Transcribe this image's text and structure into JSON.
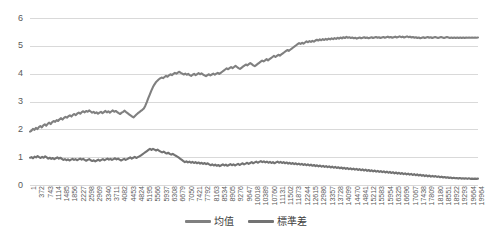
{
  "chart_data": {
    "type": "line",
    "title": "",
    "xlabel": "",
    "ylabel": "",
    "ylim": [
      0,
      6
    ],
    "yticks": [
      0,
      1,
      2,
      3,
      4,
      5,
      6
    ],
    "grid": true,
    "legend_position": "bottom",
    "x_tick_step": 371,
    "x_first": 1,
    "x_last": 19964,
    "xtick_labels": [
      "1",
      "372",
      "743",
      "1114",
      "1485",
      "1856",
      "2227",
      "2598",
      "2969",
      "3340",
      "3711",
      "4082",
      "4453",
      "4824",
      "5195",
      "5566",
      "5937",
      "6308",
      "6679",
      "7050",
      "7421",
      "7792",
      "8163",
      "8534",
      "8905",
      "9276",
      "9647",
      "10018",
      "10389",
      "10760",
      "11131",
      "11502",
      "11873",
      "12244",
      "12615",
      "12986",
      "13357",
      "13728",
      "14099",
      "14470",
      "14841",
      "15212",
      "15583",
      "15954",
      "16325",
      "16696",
      "17067",
      "17438",
      "17809",
      "18180",
      "18551",
      "18922",
      "19293",
      "19664",
      "19964"
    ],
    "series": [
      {
        "name": "均值",
        "color": "#808080",
        "values": [
          1.92,
          1.95,
          2.02,
          1.98,
          2.05,
          2.01,
          2.08,
          2.12,
          2.07,
          2.14,
          2.18,
          2.13,
          2.2,
          2.24,
          2.19,
          2.26,
          2.3,
          2.27,
          2.33,
          2.3,
          2.36,
          2.4,
          2.35,
          2.41,
          2.45,
          2.42,
          2.47,
          2.5,
          2.46,
          2.52,
          2.55,
          2.51,
          2.57,
          2.6,
          2.56,
          2.62,
          2.65,
          2.61,
          2.66,
          2.63,
          2.68,
          2.64,
          2.6,
          2.63,
          2.58,
          2.61,
          2.56,
          2.6,
          2.63,
          2.58,
          2.62,
          2.66,
          2.61,
          2.65,
          2.6,
          2.64,
          2.68,
          2.63,
          2.66,
          2.62,
          2.58,
          2.55,
          2.6,
          2.63,
          2.67,
          2.62,
          2.58,
          2.54,
          2.5,
          2.46,
          2.43,
          2.48,
          2.53,
          2.58,
          2.62,
          2.66,
          2.7,
          2.75,
          2.85,
          2.98,
          3.12,
          3.25,
          3.38,
          3.5,
          3.6,
          3.68,
          3.74,
          3.79,
          3.83,
          3.86,
          3.84,
          3.88,
          3.92,
          3.89,
          3.94,
          3.98,
          3.95,
          3.99,
          4.03,
          4.0,
          4.04,
          4.07,
          4.03,
          4.0,
          3.97,
          4.0,
          3.96,
          3.99,
          3.95,
          3.92,
          3.96,
          3.99,
          3.95,
          3.98,
          4.02,
          3.98,
          4.01,
          3.97,
          3.94,
          3.91,
          3.95,
          3.98,
          3.94,
          3.97,
          4.0,
          3.96,
          4.0,
          4.03,
          3.99,
          4.03,
          4.07,
          4.11,
          4.15,
          4.19,
          4.16,
          4.2,
          4.24,
          4.2,
          4.24,
          4.28,
          4.24,
          4.2,
          4.17,
          4.21,
          4.25,
          4.29,
          4.33,
          4.3,
          4.34,
          4.38,
          4.34,
          4.3,
          4.27,
          4.31,
          4.35,
          4.39,
          4.43,
          4.47,
          4.44,
          4.48,
          4.52,
          4.48,
          4.52,
          4.56,
          4.6,
          4.64,
          4.6,
          4.64,
          4.68,
          4.65,
          4.69,
          4.73,
          4.77,
          4.81,
          4.85,
          4.82,
          4.86,
          4.9,
          4.94,
          4.98,
          5.02,
          5.06,
          5.1,
          5.07,
          5.11,
          5.08,
          5.12,
          5.16,
          5.13,
          5.17,
          5.14,
          5.18,
          5.15,
          5.19,
          5.22,
          5.19,
          5.23,
          5.2,
          5.24,
          5.21,
          5.25,
          5.22,
          5.26,
          5.23,
          5.27,
          5.24,
          5.28,
          5.25,
          5.29,
          5.26,
          5.3,
          5.27,
          5.31,
          5.28,
          5.32,
          5.29,
          5.31,
          5.28,
          5.3,
          5.27,
          5.29,
          5.26,
          5.28,
          5.3,
          5.27,
          5.29,
          5.31,
          5.28,
          5.3,
          5.27,
          5.29,
          5.31,
          5.28,
          5.3,
          5.32,
          5.29,
          5.31,
          5.28,
          5.3,
          5.32,
          5.29,
          5.31,
          5.33,
          5.3,
          5.32,
          5.29,
          5.31,
          5.33,
          5.3,
          5.32,
          5.34,
          5.31,
          5.33,
          5.3,
          5.32,
          5.34,
          5.31,
          5.33,
          5.3,
          5.32,
          5.29,
          5.31,
          5.28,
          5.3,
          5.27,
          5.29,
          5.31,
          5.28,
          5.3,
          5.32,
          5.29,
          5.31,
          5.28,
          5.3,
          5.32,
          5.3,
          5.28,
          5.3,
          5.32,
          5.3,
          5.28,
          5.3,
          5.32,
          5.3,
          5.28,
          5.3,
          5.28,
          5.3,
          5.28,
          5.3,
          5.28,
          5.3,
          5.28,
          5.3,
          5.28,
          5.3,
          5.29,
          5.3,
          5.29,
          5.3,
          5.29,
          5.3,
          5.29,
          5.3
        ]
      },
      {
        "name": "標準差",
        "color": "#737373",
        "values": [
          0.98,
          1.0,
          0.96,
          1.02,
          0.99,
          1.04,
          1.0,
          0.97,
          1.01,
          0.98,
          1.03,
          0.99,
          0.95,
          0.98,
          0.94,
          0.97,
          0.93,
          0.96,
          0.99,
          0.95,
          0.98,
          0.94,
          0.9,
          0.93,
          0.89,
          0.92,
          0.88,
          0.91,
          0.94,
          0.9,
          0.93,
          0.89,
          0.92,
          0.95,
          0.91,
          0.94,
          0.9,
          0.87,
          0.9,
          0.93,
          0.89,
          0.86,
          0.89,
          0.85,
          0.88,
          0.91,
          0.87,
          0.9,
          0.93,
          0.89,
          0.92,
          0.95,
          0.91,
          0.94,
          0.9,
          0.93,
          0.96,
          0.92,
          0.95,
          0.91,
          0.88,
          0.91,
          0.94,
          0.9,
          0.93,
          0.96,
          0.99,
          0.95,
          0.98,
          1.01,
          0.97,
          1.0,
          1.03,
          1.06,
          1.1,
          1.14,
          1.18,
          1.22,
          1.26,
          1.3,
          1.26,
          1.3,
          1.27,
          1.24,
          1.27,
          1.23,
          1.2,
          1.17,
          1.2,
          1.16,
          1.13,
          1.16,
          1.12,
          1.09,
          1.12,
          1.08,
          1.05,
          1.02,
          0.98,
          0.94,
          0.9,
          0.86,
          0.82,
          0.85,
          0.81,
          0.84,
          0.8,
          0.83,
          0.79,
          0.82,
          0.78,
          0.81,
          0.77,
          0.8,
          0.76,
          0.79,
          0.75,
          0.78,
          0.74,
          0.71,
          0.74,
          0.7,
          0.73,
          0.69,
          0.72,
          0.68,
          0.71,
          0.74,
          0.7,
          0.73,
          0.69,
          0.72,
          0.75,
          0.71,
          0.74,
          0.7,
          0.73,
          0.76,
          0.72,
          0.75,
          0.78,
          0.74,
          0.77,
          0.8,
          0.76,
          0.79,
          0.82,
          0.78,
          0.81,
          0.84,
          0.8,
          0.83,
          0.86,
          0.82,
          0.85,
          0.81,
          0.84,
          0.8,
          0.83,
          0.79,
          0.82,
          0.78,
          0.81,
          0.84,
          0.8,
          0.83,
          0.79,
          0.82,
          0.78,
          0.81,
          0.77,
          0.8,
          0.76,
          0.79,
          0.75,
          0.78,
          0.74,
          0.77,
          0.73,
          0.76,
          0.72,
          0.75,
          0.71,
          0.74,
          0.7,
          0.73,
          0.69,
          0.72,
          0.68,
          0.71,
          0.67,
          0.7,
          0.66,
          0.69,
          0.65,
          0.68,
          0.64,
          0.67,
          0.63,
          0.66,
          0.62,
          0.65,
          0.61,
          0.64,
          0.6,
          0.63,
          0.59,
          0.62,
          0.58,
          0.61,
          0.57,
          0.6,
          0.56,
          0.59,
          0.55,
          0.58,
          0.54,
          0.57,
          0.53,
          0.56,
          0.52,
          0.55,
          0.51,
          0.54,
          0.5,
          0.53,
          0.49,
          0.52,
          0.48,
          0.51,
          0.47,
          0.5,
          0.46,
          0.49,
          0.45,
          0.48,
          0.44,
          0.47,
          0.43,
          0.46,
          0.42,
          0.45,
          0.41,
          0.44,
          0.4,
          0.43,
          0.39,
          0.42,
          0.38,
          0.41,
          0.37,
          0.4,
          0.36,
          0.39,
          0.35,
          0.38,
          0.34,
          0.37,
          0.33,
          0.36,
          0.32,
          0.35,
          0.31,
          0.34,
          0.3,
          0.33,
          0.3,
          0.32,
          0.29,
          0.31,
          0.28,
          0.3,
          0.27,
          0.29,
          0.26,
          0.28,
          0.25,
          0.27,
          0.24,
          0.26,
          0.24,
          0.25,
          0.23,
          0.25,
          0.23,
          0.24,
          0.23,
          0.24,
          0.22,
          0.24,
          0.22,
          0.23,
          0.22,
          0.23,
          0.22,
          0.23
        ]
      }
    ]
  },
  "legend": {
    "items": [
      {
        "label": "均值",
        "color": "#808080"
      },
      {
        "label": "標準差",
        "color": "#737373"
      }
    ]
  },
  "axis": {
    "gridline_color": "#d9d9d9",
    "tick_text_color": "#595959"
  }
}
